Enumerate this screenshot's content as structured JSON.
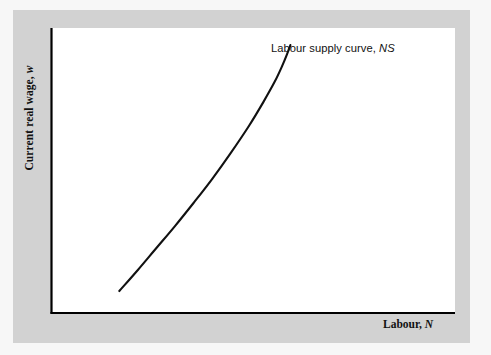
{
  "figure": {
    "background_color": "#f7f7f7",
    "frame_color": "#d2d2d2",
    "panel_color": "#ffffff",
    "axis_color": "#000000",
    "curve_color": "#111111"
  },
  "labels": {
    "y_axis_text": "Current real wage,",
    "y_axis_variable": "w",
    "x_axis_text": "Labour,",
    "x_axis_variable": "N",
    "curve_annotation_text": "Labour supply curve,",
    "curve_annotation_variable": "NS"
  },
  "chart_data": {
    "type": "line",
    "title": "",
    "subtitle": "",
    "xlabel": "Labour, N",
    "ylabel": "Current real wage, w",
    "grid": false,
    "legend": false,
    "axis_ticks": false,
    "axis_tick_labels": [],
    "xlim": [
      0,
      1
    ],
    "ylim": [
      0,
      1
    ],
    "annotations": [
      {
        "text": "Labour supply curve, NS",
        "x": 0.56,
        "y": 0.93,
        "anchor": "left"
      }
    ],
    "series": [
      {
        "name": "Labour supply curve, NS",
        "description": "Upward-sloping convex labour supply schedule; quantity of labour supplied rises with the current real wage, becoming progressively steeper at higher wages.",
        "color": "#111111",
        "line_width": 2.1,
        "x": [
          0.168,
          0.214,
          0.26,
          0.306,
          0.352,
          0.398,
          0.444,
          0.49,
          0.525,
          0.553,
          0.572,
          0.584,
          0.592
        ],
        "y": [
          0.077,
          0.151,
          0.228,
          0.305,
          0.386,
          0.47,
          0.561,
          0.658,
          0.74,
          0.811,
          0.868,
          0.909,
          0.94
        ]
      }
    ]
  }
}
